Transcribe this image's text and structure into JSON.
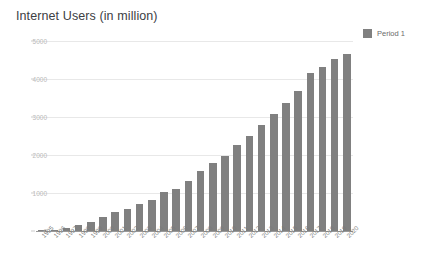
{
  "chart_data": {
    "type": "bar",
    "title": "Internet Users (in million)",
    "xlabel": "",
    "ylabel": "",
    "ylim": [
      0,
      5000
    ],
    "grid": true,
    "legend_position": "right",
    "bar_color": "#808080",
    "categories": [
      "1995",
      "1996",
      "1997",
      "1998",
      "1999",
      "2000",
      "2001",
      "2002",
      "2003",
      "2004",
      "2005",
      "2006",
      "2007",
      "2008",
      "2009",
      "2010",
      "2011",
      "2012",
      "2013",
      "2014",
      "2015",
      "2016",
      "2017",
      "2018",
      "2019",
      "2020"
    ],
    "yticks": [
      0,
      1000,
      2000,
      3000,
      4000,
      5000
    ],
    "ytick_labels": [
      "0",
      "1000",
      "2000",
      "3000",
      "4000",
      "5000"
    ],
    "series": [
      {
        "name": "Period 1",
        "color": "#808080",
        "values": [
          16,
          36,
          70,
          147,
          248,
          361,
          503,
          587,
          719,
          817,
          1024,
          1093,
          1319,
          1574,
          1802,
          1971,
          2267,
          2497,
          2802,
          3079,
          3366,
          3696,
          4156,
          4313,
          4536,
          4648
        ]
      }
    ]
  },
  "legend": {
    "entries": [
      {
        "label": "Period 1",
        "color": "#808080"
      }
    ]
  }
}
